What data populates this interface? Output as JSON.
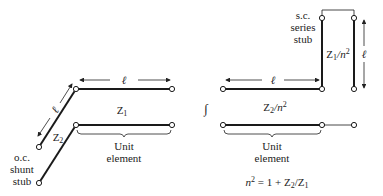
{
  "left_circuit": {
    "length_label": "ℓ",
    "stub_length_label": "ℓ",
    "line_impedance": {
      "base": "Z",
      "sub": "1"
    },
    "stub_impedance": {
      "base": "Z",
      "sub": "2"
    },
    "unit_element_label": [
      "Unit",
      "element"
    ],
    "stub_label": [
      "o.c.",
      "shunt",
      "stub"
    ]
  },
  "equivalence_symbol": "∫",
  "right_circuit": {
    "length_label": "ℓ",
    "stub_length_label": "ℓ",
    "stub_label": [
      "s.c.",
      "series",
      "stub"
    ],
    "stub_impedance": {
      "base": "Z",
      "sub": "1",
      "rest": "/n",
      "sup": "2"
    },
    "line_impedance": {
      "base": "Z",
      "sub": "2",
      "rest": "/n",
      "sup": "2"
    },
    "unit_element_label": [
      "Unit",
      "element"
    ],
    "formula": {
      "lhs": "n",
      "lhs_sup": "2",
      "rhs": " = 1 + Z",
      "rhs_sub1": "2",
      "mid": "/Z",
      "rhs_sub2": "1"
    }
  },
  "colors": {
    "line": "#1a1a1a",
    "text": "#222222"
  }
}
